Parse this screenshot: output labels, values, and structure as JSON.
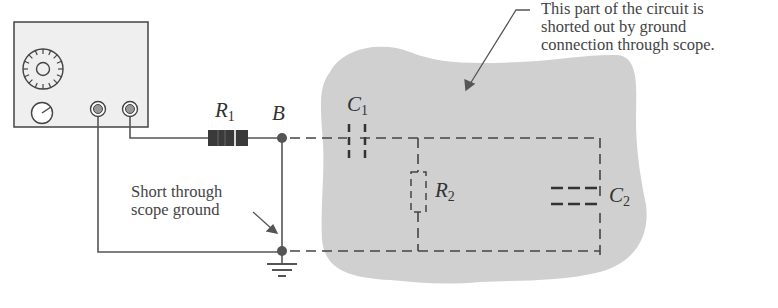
{
  "figure": {
    "annotation_top": {
      "lines": [
        "This part of the circuit is",
        "shorted out by ground",
        "connection through scope."
      ]
    },
    "annotation_left": {
      "lines": [
        "Short through",
        "scope ground"
      ]
    },
    "labels": {
      "r1": {
        "main": "R",
        "sub": "1"
      },
      "node_b": "B",
      "c1": {
        "main": "C",
        "sub": "1"
      },
      "r2": {
        "main": "R",
        "sub": "2"
      },
      "c2": {
        "main": "C",
        "sub": "2"
      }
    },
    "colors": {
      "wire": "#555555",
      "shaded_region": "#cfcfcf",
      "scope_face": "#eeeeee",
      "text": "#3a3a3a"
    }
  }
}
